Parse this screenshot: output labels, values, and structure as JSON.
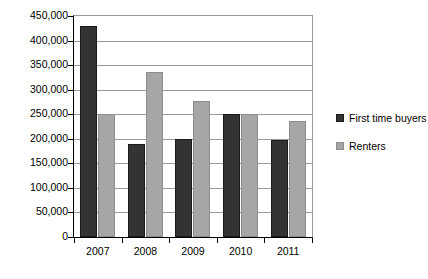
{
  "chart_data": {
    "type": "bar",
    "title": "",
    "subtitle": "",
    "xlabel": "",
    "ylabel": "",
    "categories": [
      "2007",
      "2008",
      "2009",
      "2010",
      "2011"
    ],
    "series": [
      {
        "name": "First time buyers",
        "color": "#333333",
        "values": [
          430000,
          190000,
          200000,
          250000,
          197000
        ]
      },
      {
        "name": "Renters",
        "color": "#a6a6a6",
        "values": [
          250000,
          335000,
          277000,
          250000,
          237000
        ]
      }
    ],
    "ylim": [
      0,
      450000
    ],
    "ytick_values": [
      0,
      50000,
      100000,
      150000,
      200000,
      250000,
      300000,
      350000,
      400000,
      450000
    ],
    "ytick_labels": [
      "0",
      "50,000",
      "100,000",
      "150,000",
      "200,000",
      "250,000",
      "300,000",
      "350,000",
      "400,000",
      "450,000"
    ],
    "grid": true,
    "grid_axis": "y",
    "legend_position": "right",
    "legend_entries": [
      "First time buyers",
      "Renters"
    ],
    "annotations": []
  }
}
